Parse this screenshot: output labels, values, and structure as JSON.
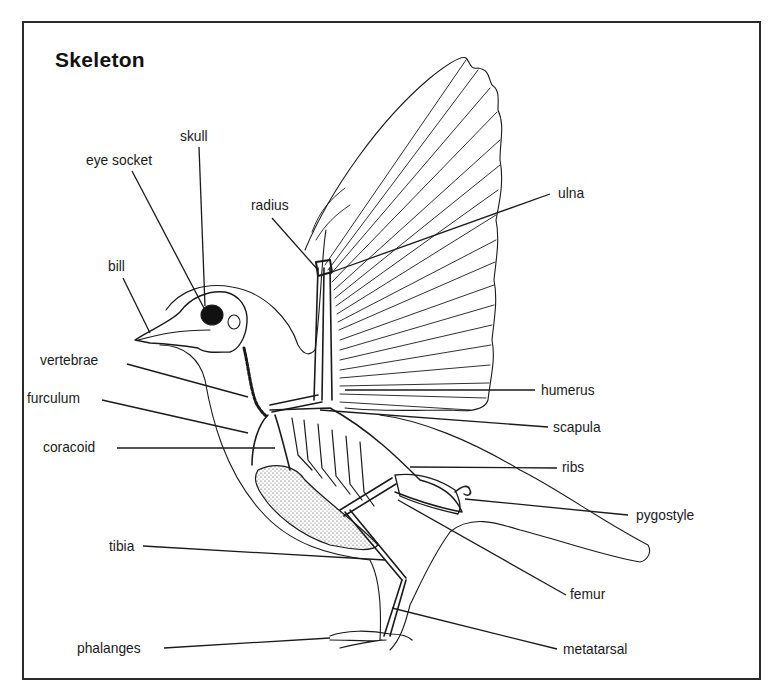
{
  "diagram": {
    "title": "Skeleton",
    "colors": {
      "ink": "#1a1a1a",
      "background": "#ffffff",
      "frame": "#2a2a2a"
    },
    "labels": {
      "skull": "skull",
      "eye_socket": "eye socket",
      "radius": "radius",
      "ulna": "ulna",
      "bill": "bill",
      "vertebrae": "vertebrae",
      "furculum": "furculum",
      "coracoid": "coracoid",
      "humerus": "humerus",
      "scapula": "scapula",
      "ribs": "ribs",
      "pygostyle": "pygostyle",
      "tibia": "tibia",
      "femur": "femur",
      "phalanges": "phalanges",
      "metatarsal": "metatarsal"
    }
  }
}
